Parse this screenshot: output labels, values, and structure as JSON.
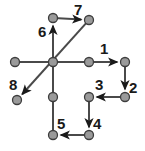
{
  "diagram": {
    "type": "node-link-diagram",
    "canvas": {
      "width": 145,
      "height": 151
    },
    "colors": {
      "background": "#ffffff",
      "node_fill": "#9a9a9a",
      "node_stroke": "#3d3d3d",
      "edge": "#4a4a4a",
      "arrow": "#1a1a1a",
      "label": "#1a1a1a"
    },
    "node_radius": 4.5,
    "nodes": [
      {
        "id": "hub",
        "name": "center-hub-node",
        "x": 53,
        "y": 62
      },
      {
        "id": "west",
        "name": "west-end-node",
        "x": 15,
        "y": 62
      },
      {
        "id": "mid-east",
        "name": "mid-east-node",
        "x": 89,
        "y": 62
      },
      {
        "id": "east",
        "name": "east-corner-node",
        "x": 125,
        "y": 62
      },
      {
        "id": "east-low",
        "name": "east-lower-node",
        "x": 125,
        "y": 97
      },
      {
        "id": "inner-low",
        "name": "inner-lower-node",
        "x": 89,
        "y": 97
      },
      {
        "id": "inner-bot",
        "name": "inner-bottom-node",
        "x": 89,
        "y": 135
      },
      {
        "id": "bottom",
        "name": "bottom-left-node",
        "x": 53,
        "y": 135
      },
      {
        "id": "mid-south",
        "name": "mid-south-node",
        "x": 53,
        "y": 97
      },
      {
        "id": "upper",
        "name": "upper-column-node",
        "x": 53,
        "y": 18
      },
      {
        "id": "top-right",
        "name": "top-right-node",
        "x": 89,
        "y": 20
      },
      {
        "id": "southwest",
        "name": "southwest-node",
        "x": 17,
        "y": 100
      }
    ],
    "edges": [
      {
        "name": "edge-west-hub",
        "from": "west",
        "to": "hub",
        "directed": false
      },
      {
        "name": "edge-hub-mid-east",
        "from": "hub",
        "to": "mid-east",
        "directed": false
      },
      {
        "name": "edge-mid-east-east",
        "from": "mid-east",
        "to": "east",
        "directed": true
      },
      {
        "name": "edge-east-east-low",
        "from": "east",
        "to": "east-low",
        "directed": true
      },
      {
        "name": "edge-east-low-inner-low",
        "from": "east-low",
        "to": "inner-low",
        "directed": true
      },
      {
        "name": "edge-inner-low-inner-bot",
        "from": "inner-low",
        "to": "inner-bot",
        "directed": true
      },
      {
        "name": "edge-inner-bot-bottom",
        "from": "inner-bot",
        "to": "bottom",
        "directed": true
      },
      {
        "name": "edge-bottom-mid-south",
        "from": "bottom",
        "to": "mid-south",
        "directed": false
      },
      {
        "name": "edge-mid-south-upper",
        "from": "mid-south",
        "to": "upper",
        "directed": true
      },
      {
        "name": "edge-upper-top-right",
        "from": "upper",
        "to": "top-right",
        "directed": true
      },
      {
        "name": "edge-top-right-southwest",
        "from": "top-right",
        "to": "southwest",
        "directed": true
      }
    ],
    "steps": [
      {
        "id": 1,
        "label": "1",
        "name": "step-label-1",
        "x": 100,
        "y": 41
      },
      {
        "id": 2,
        "label": "2",
        "name": "step-label-2",
        "x": 129,
        "y": 80
      },
      {
        "id": 3,
        "label": "3",
        "name": "step-label-3",
        "x": 95,
        "y": 77
      },
      {
        "id": 4,
        "label": "4",
        "name": "step-label-4",
        "x": 93,
        "y": 116
      },
      {
        "id": 5,
        "label": "5",
        "name": "step-label-5",
        "x": 57,
        "y": 116
      },
      {
        "id": 6,
        "label": "6",
        "name": "step-label-6",
        "x": 38,
        "y": 24
      },
      {
        "id": 7,
        "label": "7",
        "name": "step-label-7",
        "x": 74,
        "y": 2
      },
      {
        "id": 8,
        "label": "8",
        "name": "step-label-8",
        "x": 9,
        "y": 77
      }
    ]
  }
}
